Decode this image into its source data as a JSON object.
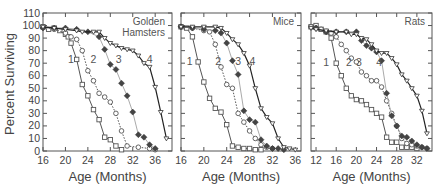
{
  "chart_data": {
    "type": "line",
    "ylabel": "Percent Surviving",
    "y_ticks": [
      0,
      10,
      20,
      30,
      40,
      50,
      60,
      70,
      80,
      90,
      100,
      110
    ],
    "ylim": [
      0,
      110
    ],
    "grid": false,
    "legend": "none (curves labeled 1-4 inline)",
    "series_styles": {
      "1": {
        "marker": "open-square",
        "line": "solid",
        "color": "#555555"
      },
      "2": {
        "marker": "open-circle",
        "line": "dotted",
        "color": "#555555"
      },
      "3": {
        "marker": "filled-diamond",
        "line": "solid",
        "color": "#aaaaaa",
        "marker_color": "#444444"
      },
      "4": {
        "marker": "open-triangle-down",
        "line": "solid",
        "color": "#222222"
      }
    },
    "panels": [
      {
        "title_lines": [
          "Golden",
          "Hamsters"
        ],
        "xlabel": "Age (Months)",
        "x_ticks": [
          16,
          20,
          24,
          28,
          32,
          36
        ],
        "xlim": [
          16,
          39
        ],
        "series": [
          {
            "name": "1",
            "label_pos": [
              21,
              73
            ],
            "x": [
              16,
              17,
              18,
              19,
              20,
              20.5,
              21,
              22,
              23,
              24,
              25,
              26,
              27,
              28,
              29,
              30
            ],
            "y": [
              99,
              97,
              98,
              96,
              93,
              91,
              86,
              73,
              53,
              44,
              33,
              25,
              11,
              9,
              4,
              1
            ]
          },
          {
            "name": "2",
            "label_pos": [
              25,
              73
            ],
            "x": [
              16,
              18,
              20,
              21,
              22,
              23,
              24,
              25,
              26,
              27,
              28,
              29,
              30,
              31,
              33,
              35,
              36
            ],
            "y": [
              99,
              97,
              94,
              91,
              89,
              80,
              64,
              56,
              46,
              43,
              39,
              30,
              16,
              4,
              3,
              2,
              1
            ]
          },
          {
            "name": "3",
            "label_pos": [
              29.5,
              73
            ],
            "x": [
              16,
              18,
              20,
              22,
              24,
              26,
              27,
              28,
              29,
              30,
              31,
              32,
              33,
              34,
              35,
              36
            ],
            "y": [
              98,
              98,
              98,
              97,
              95,
              91,
              81,
              69,
              65,
              54,
              44,
              31,
              13,
              11,
              5,
              2
            ]
          },
          {
            "name": "4",
            "label_pos": [
              35,
              73
            ],
            "x": [
              16,
              18,
              20,
              22,
              23,
              25,
              26,
              27,
              28,
              29,
              30,
              31,
              32,
              33,
              34,
              35,
              36,
              37,
              38
            ],
            "y": [
              99,
              98,
              97,
              96,
              95,
              95,
              95,
              90,
              86,
              84,
              82,
              81,
              80,
              76,
              70,
              67,
              51,
              31,
              10
            ]
          }
        ]
      },
      {
        "title_lines": [
          "Mice"
        ],
        "xlabel": "Age (Months)",
        "x_ticks": [
          16,
          20,
          24,
          28,
          32,
          36
        ],
        "xlim": [
          16,
          37
        ],
        "series": [
          {
            "name": "1",
            "label_pos": [
              17.5,
              72
            ],
            "x": [
              16,
              17,
              18,
              19,
              20,
              21,
              22,
              23,
              24,
              25,
              26,
              27,
              28,
              29,
              30
            ],
            "y": [
              99,
              98,
              91,
              71,
              55,
              42,
              34,
              31,
              21,
              4,
              3,
              2,
              2,
              1,
              1
            ]
          },
          {
            "name": "2",
            "label_pos": [
              22.5,
              72
            ],
            "x": [
              16,
              18,
              20,
              21,
              22,
              23,
              24,
              25,
              26,
              27,
              28,
              29,
              30,
              31,
              32
            ],
            "y": [
              99,
              98,
              96,
              95,
              85,
              67,
              53,
              50,
              30,
              23,
              16,
              10,
              5,
              3,
              2
            ]
          },
          {
            "name": "3",
            "label_pos": [
              26,
              72
            ],
            "x": [
              16,
              18,
              20,
              22,
              23,
              24,
              25,
              26,
              27,
              28,
              29,
              30,
              31,
              32,
              33,
              34
            ],
            "y": [
              99,
              98,
              97,
              96,
              94,
              86,
              72,
              61,
              32,
              25,
              23,
              9,
              4,
              2,
              2,
              1
            ]
          },
          {
            "name": "4",
            "label_pos": [
              28.5,
              72
            ],
            "x": [
              16,
              18,
              20,
              22,
              23,
              24,
              25,
              26,
              27,
              28,
              29,
              30,
              31,
              32,
              33,
              34,
              35,
              36
            ],
            "y": [
              99,
              99,
              99,
              99,
              98,
              94,
              89,
              85,
              78,
              68,
              50,
              34,
              27,
              22,
              10,
              3,
              2,
              1
            ]
          }
        ]
      },
      {
        "title_lines": [
          "Rats"
        ],
        "xlabel": "Age (Months)",
        "x_ticks": [
          12,
          16,
          20,
          24,
          28,
          32
        ],
        "xlim": [
          11,
          35
        ],
        "series": [
          {
            "name": "1",
            "label_pos": [
              14,
              71
            ],
            "x": [
              11,
              12,
              13,
              14,
              15,
              16,
              17,
              18,
              19,
              20,
              21,
              22,
              23,
              24,
              25,
              26,
              27,
              28,
              29,
              30,
              31,
              32
            ],
            "y": [
              99,
              100,
              97,
              95,
              90,
              70,
              60,
              50,
              44,
              41,
              40,
              37,
              33,
              30,
              27,
              11,
              7,
              7,
              3,
              3,
              3,
              2
            ]
          },
          {
            "name": "2",
            "label_pos": [
              18.5,
              71
            ],
            "x": [
              11,
              12,
              13,
              14,
              15,
              16,
              17,
              18,
              19,
              20,
              21,
              22,
              23,
              24,
              25,
              26,
              27,
              28,
              29,
              30,
              31,
              32,
              33,
              34
            ],
            "y": [
              99,
              98,
              97,
              95,
              94,
              91,
              85,
              80,
              74,
              71,
              63,
              60,
              56,
              56,
              51,
              40,
              30,
              20,
              10,
              6,
              5,
              4,
              3,
              2
            ]
          },
          {
            "name": "3",
            "label_pos": [
              20.5,
              71
            ],
            "x": [
              12,
              14,
              16,
              18,
              20,
              21,
              22,
              23,
              24,
              25,
              26,
              27,
              28,
              29,
              30,
              31,
              32,
              33,
              34
            ],
            "y": [
              98,
              95,
              95,
              95,
              95,
              88,
              84,
              82,
              79,
              72,
              46,
              28,
              20,
              12,
              11,
              8,
              5,
              3,
              2
            ]
          },
          {
            "name": "4",
            "label_pos": [
              24.5,
              71
            ],
            "x": [
              11,
              12,
              14,
              16,
              18,
              19,
              20,
              21,
              22,
              23,
              24,
              25,
              26,
              27,
              28,
              29,
              30,
              31,
              32,
              33,
              34
            ],
            "y": [
              98,
              97,
              96,
              95,
              95,
              93,
              93,
              90,
              89,
              85,
              80,
              78,
              78,
              74,
              69,
              61,
              56,
              50,
              44,
              32,
              14
            ]
          }
        ]
      }
    ]
  }
}
